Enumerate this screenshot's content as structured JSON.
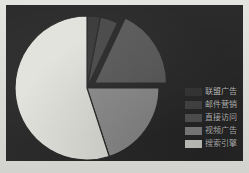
{
  "chart_data": {
    "type": "pie",
    "title": "",
    "subtitle": "",
    "xlabel": "",
    "ylabel": "",
    "grid": false,
    "legend_position": "right",
    "center": [
      81,
      83
    ],
    "radius": 72,
    "start_angle": 90,
    "background_color": "#2b2b2b",
    "categories": [
      "联盟广告",
      "邮件营销",
      "直接访问",
      "视频广告",
      "搜索引擎"
    ],
    "values": [
      3,
      4,
      18,
      20,
      55
    ],
    "colors": [
      "#3a3a3a",
      "#4a4a4a",
      "#5c5c5c",
      "#8f8f8f",
      "#e2e2dd"
    ],
    "slices": [
      {
        "name": "联盟广告",
        "value": 3,
        "color": "#3a3a3a",
        "exploded": false
      },
      {
        "name": "邮件营销",
        "value": 4,
        "color": "#4a4a4a",
        "exploded": false
      },
      {
        "name": "直接访问",
        "value": 18,
        "color": "#5c5c5c",
        "exploded": true
      },
      {
        "name": "视频广告",
        "value": 20,
        "color": "#8f8f8f",
        "exploded": false
      },
      {
        "name": "搜索引擎",
        "value": 55,
        "color": "#e2e2dd",
        "exploded": false
      }
    ]
  },
  "legend": {
    "items": [
      {
        "label": "联盟广告",
        "color": "#3a3a3a"
      },
      {
        "label": "邮件营销",
        "color": "#4a4a4a"
      },
      {
        "label": "直接访问",
        "color": "#5c5c5c"
      },
      {
        "label": "视频广告",
        "color": "#8f8f8f"
      },
      {
        "label": "搜索引擎",
        "color": "#e2e2dd"
      }
    ]
  }
}
